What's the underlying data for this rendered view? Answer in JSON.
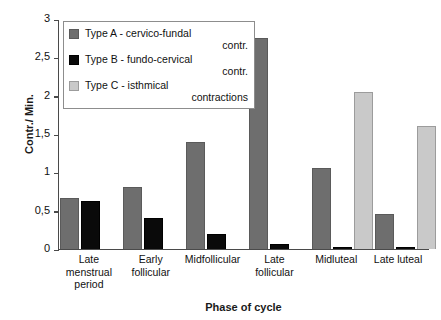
{
  "chart_data": {
    "type": "bar",
    "title": "",
    "xlabel": "Phase of cycle",
    "ylabel": "Contr./ Min.",
    "ylim": [
      0,
      3
    ],
    "ytick_labels": [
      "3",
      "2,5",
      "2",
      "1,5",
      "1",
      "0,5",
      "0"
    ],
    "ytick_values": [
      3,
      2.5,
      2,
      1.5,
      1,
      0.5,
      0
    ],
    "grid": false,
    "legend_position": "upper left",
    "categories": [
      "Late menstrual period",
      "Early follicular",
      "Midfollicular",
      "Late follicular",
      "Midluteal",
      "Late luteal"
    ],
    "category_lines": [
      [
        "Late",
        "menstrual",
        "period"
      ],
      [
        "Early",
        "follicular"
      ],
      [
        "Midfollicular"
      ],
      [
        "Late",
        "follicular"
      ],
      [
        "Midluteal"
      ],
      [
        "Late luteal"
      ]
    ],
    "series": [
      {
        "name": "Type A - cervico-fundal contr.",
        "legend_lines": [
          "Type A - cervico-fundal",
          "contr."
        ],
        "color": "#6e6e6e",
        "values": [
          0.67,
          0.81,
          1.4,
          2.75,
          1.06,
          0.46
        ]
      },
      {
        "name": "Type B - fundo-cervical contr.",
        "legend_lines": [
          "Type B - fundo-cervical",
          "contr."
        ],
        "color": "#0a0a0a",
        "values": [
          0.62,
          0.4,
          0.2,
          0.07,
          0.03,
          0.03
        ]
      },
      {
        "name": "Type C - isthmical contractions",
        "legend_lines": [
          "Type C - isthmical",
          "contractions"
        ],
        "color": "#c9c9c9",
        "values": [
          0,
          0,
          0,
          0,
          2.05,
          1.6
        ]
      }
    ]
  }
}
